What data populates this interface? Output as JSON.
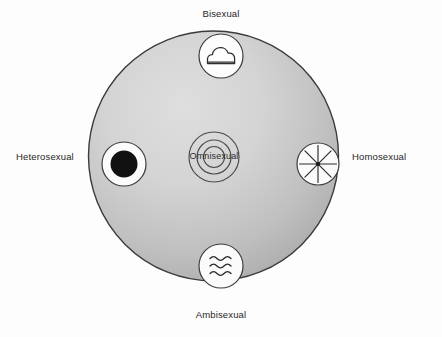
{
  "diagram": {
    "background_color": "#fdfdfd",
    "main_circle": {
      "name": "orientation-field-circle",
      "center_x": 213.5,
      "center_y": 156,
      "radius": 125,
      "fill_light": "#d9d9d9",
      "fill_dark": "#a8a8a8",
      "stroke": "#3a3a3a"
    },
    "nodes": [
      {
        "id": "bisexual",
        "label": "Bisexual",
        "icon": "cloud-icon",
        "position": "top",
        "cx": 221,
        "cy": 56,
        "r": 22,
        "label_x": 221,
        "label_y": 14
      },
      {
        "id": "heterosexual",
        "label": "Heterosexual",
        "icon": "filled-dot-icon",
        "position": "left",
        "cx": 124,
        "cy": 164,
        "r": 22,
        "label_x": 45,
        "label_y": 158
      },
      {
        "id": "homosexual",
        "label": "Homosexual",
        "icon": "asterisk-starburst-icon",
        "position": "right",
        "cx": 318,
        "cy": 164,
        "r": 21,
        "label_x": 397,
        "label_y": 158
      },
      {
        "id": "ambisexual",
        "label": "Ambisexual",
        "icon": "three-waves-icon",
        "position": "bottom",
        "cx": 221,
        "cy": 266,
        "r": 22,
        "label_x": 221,
        "label_y": 317
      },
      {
        "id": "omnisexual",
        "label": "Omnisexual",
        "icon": "concentric-rings-icon",
        "position": "center",
        "cx": 214,
        "cy": 157,
        "r": 25,
        "label_x": 214,
        "label_y": 158
      }
    ],
    "colors": {
      "icon_fill": "#ffffff",
      "icon_stroke": "#3c3c3c",
      "glyph_stroke": "#2e2e2e",
      "dot_fill": "#111111",
      "text": "#272727"
    }
  }
}
